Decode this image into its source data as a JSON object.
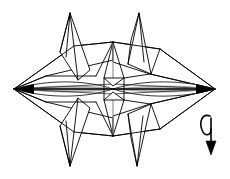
{
  "figure": {
    "description": "Symmetric folded-paper diagram with two sharp horizontal points, four diagonal spikes and a rotate arrow",
    "background_color": "#ffffff",
    "line_color": "#000000",
    "accent_gray": "#8d8d8d",
    "canvas": {
      "width": 230,
      "height": 179
    },
    "annotation": {
      "symbol_name": "rotate-arrow",
      "meaning": "rotate the model"
    },
    "geometry": {
      "left_point": {
        "x": 14,
        "y": 89
      },
      "right_point": {
        "x": 215,
        "y": 89
      },
      "center": {
        "x": 113,
        "y": 89
      },
      "top_apex": {
        "x": 113,
        "y": 42
      },
      "bottom_apex": {
        "x": 113,
        "y": 136
      },
      "spike_tips": [
        {
          "name": "upper-left-spike",
          "x": 70,
          "y": 13
        },
        {
          "name": "upper-right-spike",
          "x": 139,
          "y": 13
        },
        {
          "name": "lower-left-spike",
          "x": 70,
          "y": 166
        },
        {
          "name": "lower-right-spike",
          "x": 137,
          "y": 166
        }
      ]
    }
  }
}
